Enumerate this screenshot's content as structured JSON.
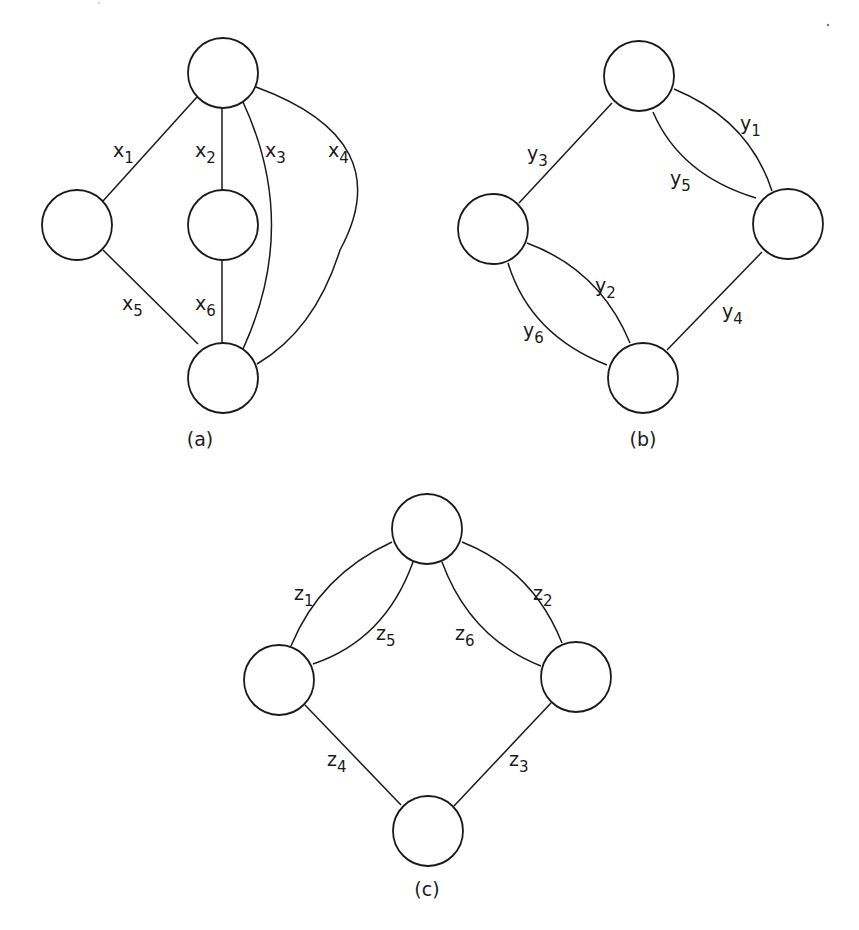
{
  "figure": {
    "top_cut_text": "— —  — — —,  — — —",
    "stroke_color": "#1a1a1a",
    "background": "#ffffff",
    "node_radius": 35,
    "panels": [
      {
        "id": "a",
        "caption": "(a)",
        "caption_pos": [
          200,
          446
        ],
        "nodes": [
          {
            "id": "a-top",
            "cx": 223,
            "cy": 73
          },
          {
            "id": "a-left",
            "cx": 77,
            "cy": 225
          },
          {
            "id": "a-middle",
            "cx": 223,
            "cy": 225
          },
          {
            "id": "a-bottom",
            "cx": 223,
            "cy": 378
          }
        ],
        "edges": [
          {
            "name": "x1",
            "var": "x",
            "sub": "1",
            "d": "M 197 97 L 103 201",
            "label_pos": [
              113,
              157
            ]
          },
          {
            "name": "x2",
            "var": "x",
            "sub": "2",
            "d": "M 222 108 L 222 190",
            "label_pos": [
              195,
              157
            ]
          },
          {
            "name": "x3",
            "var": "x",
            "sub": "3",
            "d": "M 243 102 Q 300 225 243 349",
            "label_pos": [
              265,
              157
            ]
          },
          {
            "name": "x4",
            "var": "x",
            "sub": "4",
            "d": "M 256 87 Q 400 140 340 250 Q 315 330 257 364",
            "label_pos": [
              328,
              157
            ]
          },
          {
            "name": "x5",
            "var": "x",
            "sub": "5",
            "d": "M 103 250 L 198 344",
            "label_pos": [
              122,
              310
            ]
          },
          {
            "name": "x6",
            "var": "x",
            "sub": "6",
            "d": "M 222 260 L 222 343",
            "label_pos": [
              195,
              310
            ]
          }
        ]
      },
      {
        "id": "b",
        "caption": "(b)",
        "caption_pos": [
          643,
          446
        ],
        "nodes": [
          {
            "id": "b-top",
            "cx": 639,
            "cy": 76
          },
          {
            "id": "b-left",
            "cx": 493,
            "cy": 229
          },
          {
            "id": "b-right",
            "cx": 788,
            "cy": 224
          },
          {
            "id": "b-bottom",
            "cx": 643,
            "cy": 378
          }
        ],
        "edges": [
          {
            "name": "y1",
            "var": "y",
            "sub": "1",
            "d": "M 674 89 Q 749 120 772 191",
            "label_pos": [
              740,
              130
            ]
          },
          {
            "name": "y5",
            "var": "y",
            "sub": "5",
            "d": "M 653 112 Q 680 175 756 198",
            "label_pos": [
              670,
              185
            ]
          },
          {
            "name": "y3",
            "var": "y",
            "sub": "3",
            "d": "M 612 103 L 519 203",
            "label_pos": [
              527,
              160
            ]
          },
          {
            "name": "y2",
            "var": "y",
            "sub": "2",
            "d": "M 527 243 Q 600 270 630 343",
            "label_pos": [
              595,
              292
            ]
          },
          {
            "name": "y6",
            "var": "y",
            "sub": "6",
            "d": "M 508 263 Q 530 335 607 365",
            "label_pos": [
              523,
              337
            ]
          },
          {
            "name": "y4",
            "var": "y",
            "sub": "4",
            "d": "M 762 252 L 667 350",
            "label_pos": [
              722,
              318
            ]
          }
        ]
      },
      {
        "id": "c",
        "caption": "(c)",
        "caption_pos": [
          427,
          896
        ],
        "nodes": [
          {
            "id": "c-top",
            "cx": 427,
            "cy": 529
          },
          {
            "id": "c-left",
            "cx": 279,
            "cy": 680
          },
          {
            "id": "c-right",
            "cx": 576,
            "cy": 677
          },
          {
            "id": "c-bottom",
            "cx": 428,
            "cy": 831
          }
        ],
        "edges": [
          {
            "name": "z1",
            "var": "z",
            "sub": "1",
            "d": "M 392 542 Q 320 575 291 646",
            "label_pos": [
              294,
              600
            ]
          },
          {
            "name": "z5",
            "var": "z",
            "sub": "5",
            "d": "M 413 562 Q 385 640 313 664",
            "label_pos": [
              376,
              640
            ]
          },
          {
            "name": "z6",
            "var": "z",
            "sub": "6",
            "d": "M 442 562 Q 470 638 541 666",
            "label_pos": [
              455,
              640
            ]
          },
          {
            "name": "z2",
            "var": "z",
            "sub": "2",
            "d": "M 462 542 Q 533 570 562 643",
            "label_pos": [
              533,
              600
            ]
          },
          {
            "name": "z4",
            "var": "z",
            "sub": "4",
            "d": "M 305 705 L 401 805",
            "label_pos": [
              327,
              766
            ]
          },
          {
            "name": "z3",
            "var": "z",
            "sub": "3",
            "d": "M 551 703 L 454 806",
            "label_pos": [
              509,
              766
            ]
          }
        ]
      }
    ],
    "artifacts": [
      {
        "name": "scan-speck",
        "cx": 828,
        "cy": 25,
        "r": 1.2
      }
    ]
  }
}
